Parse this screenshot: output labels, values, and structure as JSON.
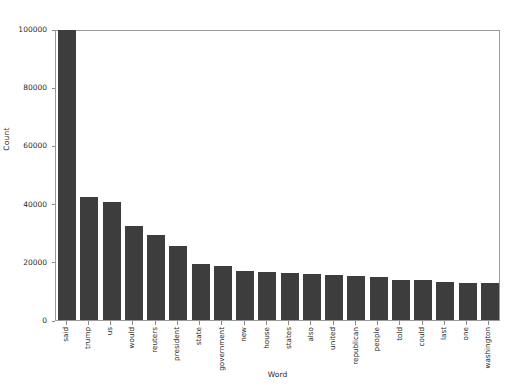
{
  "figure": {
    "background_color": "#ffffff",
    "bar_color": "#3d3d3d",
    "axis_color": "#9a9a9a",
    "title": ""
  },
  "axes": {
    "ylabel": "Count",
    "xlabel": "Word",
    "ytick_labels": [
      "0",
      "20000",
      "40000",
      "60000",
      "80000",
      "100000"
    ],
    "ytick_values": [
      0,
      20000,
      40000,
      60000,
      80000,
      100000
    ]
  },
  "chart_data": {
    "type": "bar",
    "title": "",
    "xlabel": "Word",
    "ylabel": "Count",
    "ylim": [
      0,
      100000
    ],
    "xlim": [
      -0.5,
      19.5
    ],
    "grid": false,
    "legend": null,
    "orientation": "vertical",
    "bar_color": "#3d3d3d",
    "categories": [
      "said",
      "trump",
      "us",
      "would",
      "reuters",
      "president",
      "state",
      "government",
      "new",
      "house",
      "states",
      "also",
      "united",
      "republican",
      "people",
      "told",
      "could",
      "last",
      "one",
      "washington"
    ],
    "values": [
      99500,
      42200,
      40600,
      32200,
      29300,
      25300,
      19100,
      18400,
      16800,
      16500,
      16000,
      15900,
      15500,
      15100,
      14700,
      13900,
      13700,
      12900,
      12800,
      12600
    ],
    "yticks": [
      0,
      20000,
      40000,
      60000,
      80000,
      100000
    ]
  }
}
